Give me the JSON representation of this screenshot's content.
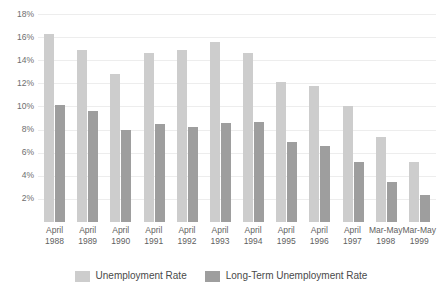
{
  "chart_data": {
    "type": "bar",
    "title": "",
    "subtitle": "",
    "xlabel": "",
    "ylabel": "",
    "ylim": [
      0,
      18
    ],
    "ytick_values": [
      18,
      16,
      14,
      12,
      10,
      8,
      6,
      4,
      2
    ],
    "ytick_labels": [
      "18%",
      "16%",
      "14%",
      "12%",
      "10%",
      "8%",
      "6%",
      "4%",
      "2%"
    ],
    "grid": true,
    "legend_position": "bottom-center",
    "categories": [
      "April 1988",
      "April 1989",
      "April 1990",
      "April 1991",
      "April 1992",
      "April 1993",
      "April 1994",
      "April 1995",
      "April 1996",
      "April 1997",
      "Mar-May 1998",
      "Mar-May 1999"
    ],
    "category_lines": [
      [
        "April",
        "1988"
      ],
      [
        "April",
        "1989"
      ],
      [
        "April",
        "1990"
      ],
      [
        "April",
        "1991"
      ],
      [
        "April",
        "1992"
      ],
      [
        "April",
        "1993"
      ],
      [
        "April",
        "1994"
      ],
      [
        "April",
        "1995"
      ],
      [
        "April",
        "1996"
      ],
      [
        "April",
        "1997"
      ],
      [
        "Mar-May",
        "1998"
      ],
      [
        "Mar-May",
        "1999"
      ]
    ],
    "series": [
      {
        "name": "Unemployment Rate",
        "color": "#cdcdcd",
        "values": [
          16.3,
          14.9,
          12.8,
          14.6,
          14.9,
          15.6,
          14.6,
          12.1,
          11.8,
          10.0,
          7.4,
          5.2
        ]
      },
      {
        "name": "Long-Term Unemployment Rate",
        "color": "#9e9e9e",
        "values": [
          10.1,
          9.6,
          8.0,
          8.5,
          8.2,
          8.6,
          8.7,
          6.9,
          6.6,
          5.2,
          3.5,
          2.3
        ]
      }
    ]
  }
}
